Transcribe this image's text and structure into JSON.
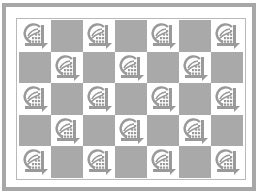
{
  "pattern": {
    "name": "checkerboard-logo-tile",
    "columns": 7,
    "rows": 5,
    "colors": {
      "border": "#a7a7a7",
      "dark_cell": "#a9a9a9",
      "light_cell": "#ffffff",
      "icon": "#9a9a9a"
    },
    "icon": "globe-grid-logo-icon",
    "cells": [
      [
        "icon",
        "dark",
        "icon",
        "dark",
        "icon",
        "dark",
        "icon"
      ],
      [
        "dark",
        "icon",
        "dark",
        "icon",
        "dark",
        "icon",
        "dark"
      ],
      [
        "icon",
        "dark",
        "icon",
        "dark",
        "icon",
        "dark",
        "icon"
      ],
      [
        "dark",
        "icon",
        "dark",
        "icon",
        "dark",
        "icon",
        "dark"
      ],
      [
        "icon",
        "dark",
        "icon",
        "dark",
        "icon",
        "dark",
        "icon"
      ]
    ]
  }
}
